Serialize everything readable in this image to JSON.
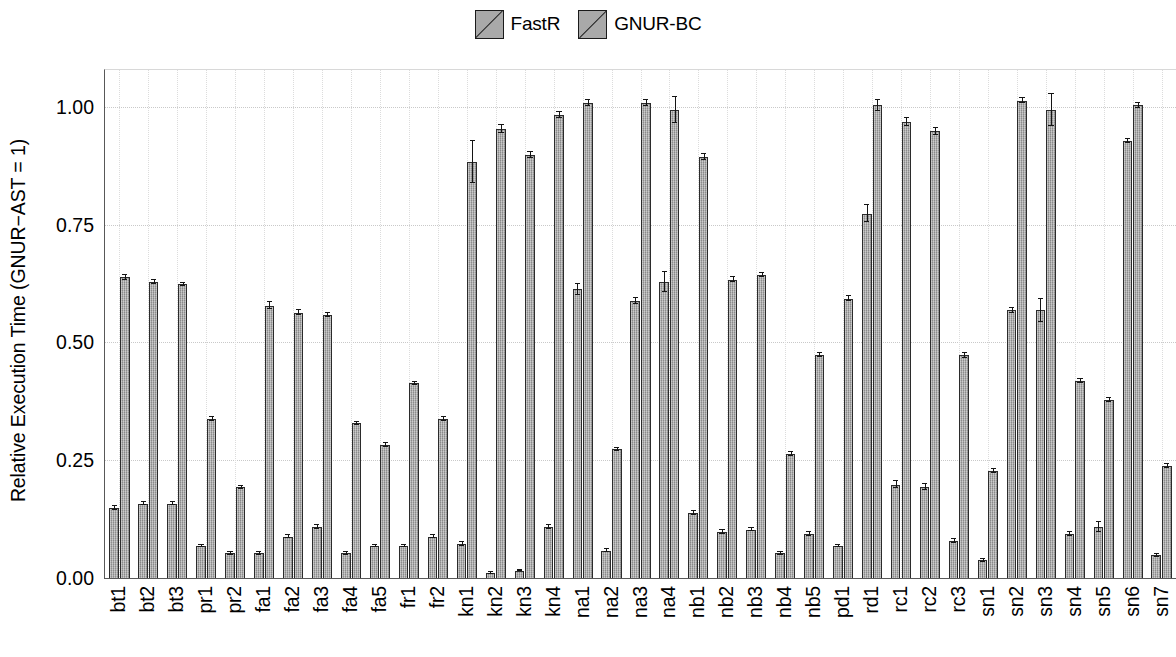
{
  "legend": {
    "position": "top-center",
    "entries": [
      {
        "label": "FastR",
        "swatch": "hatched-square-swatch",
        "color": "#a9a9a9"
      },
      {
        "label": "GNUR-BC",
        "swatch": "hatched-square-swatch",
        "color": "#a9a9a9"
      }
    ]
  },
  "axes": {
    "ylabel": "Relative Execution Time (GNUR−AST = 1)",
    "xlabel": "",
    "yticks": [
      "0.00",
      "0.25",
      "0.50",
      "0.75",
      "1.00"
    ]
  },
  "chart_data": {
    "type": "bar",
    "title": "",
    "xlabel": "",
    "ylabel": "Relative Execution Time (GNUR−AST = 1)",
    "ylim": [
      0,
      1.08
    ],
    "ytick_values": [
      0.0,
      0.25,
      0.5,
      0.75,
      1.0
    ],
    "grid": true,
    "legend_position": "top-center",
    "categories": [
      "bt1",
      "bt2",
      "bt3",
      "pr1",
      "pr2",
      "fa1",
      "fa2",
      "fa3",
      "fa4",
      "fa5",
      "fr1",
      "fr2",
      "kn1",
      "kn2",
      "kn3",
      "kn4",
      "na1",
      "na2",
      "na3",
      "na4",
      "nb1",
      "nb2",
      "nb3",
      "nb4",
      "nb5",
      "pd1",
      "rd1",
      "rc1",
      "rc2",
      "rc3",
      "sn1",
      "sn2",
      "sn3",
      "sn4",
      "sn5",
      "sn6",
      "sn7"
    ],
    "series": [
      {
        "name": "FastR",
        "values": [
          0.15,
          0.16,
          0.16,
          0.07,
          0.055,
          0.055,
          0.09,
          0.11,
          0.055,
          0.07,
          0.07,
          0.09,
          0.075,
          0.012,
          0.018,
          0.11,
          0.615,
          0.06,
          0.59,
          0.63,
          0.14,
          0.1,
          0.105,
          0.055,
          0.095,
          0.07,
          0.775,
          0.2,
          0.195,
          0.08,
          0.04,
          0.57,
          0.57,
          0.095,
          0.11,
          0.93,
          0.05
        ],
        "errors": [
          0.004,
          0.004,
          0.004,
          0.003,
          0.003,
          0.003,
          0.004,
          0.004,
          0.003,
          0.003,
          0.003,
          0.004,
          0.004,
          0.002,
          0.002,
          0.004,
          0.012,
          0.003,
          0.006,
          0.022,
          0.004,
          0.004,
          0.004,
          0.003,
          0.004,
          0.003,
          0.018,
          0.007,
          0.006,
          0.004,
          0.003,
          0.006,
          0.024,
          0.004,
          0.011,
          0.004,
          0.004
        ]
      },
      {
        "name": "GNUR-BC",
        "values": [
          0.64,
          0.63,
          0.625,
          0.34,
          0.195,
          0.58,
          0.565,
          0.56,
          0.33,
          0.285,
          0.415,
          0.34,
          0.885,
          0.955,
          0.9,
          0.985,
          1.01,
          0.275,
          1.01,
          0.995,
          0.895,
          0.635,
          0.645,
          0.265,
          0.475,
          0.595,
          1.005,
          0.97,
          0.95,
          0.475,
          0.23,
          1.015,
          0.995,
          0.42,
          0.38,
          1.005,
          0.24
        ],
        "errors": [
          0.005,
          0.004,
          0.004,
          0.004,
          0.003,
          0.008,
          0.005,
          0.005,
          0.004,
          0.004,
          0.004,
          0.004,
          0.045,
          0.008,
          0.006,
          0.006,
          0.006,
          0.004,
          0.007,
          0.028,
          0.006,
          0.005,
          0.005,
          0.004,
          0.004,
          0.005,
          0.012,
          0.008,
          0.007,
          0.005,
          0.004,
          0.006,
          0.034,
          0.005,
          0.005,
          0.005,
          0.005
        ]
      }
    ]
  }
}
